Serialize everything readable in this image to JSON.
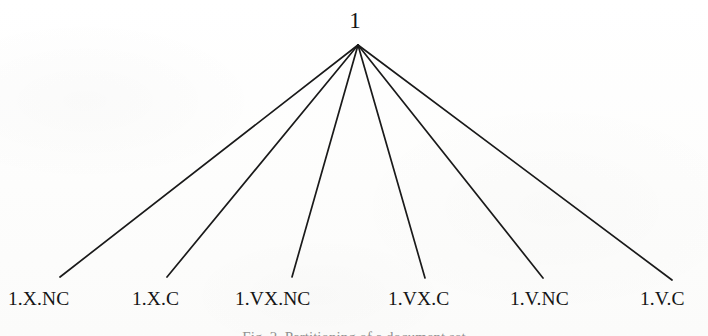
{
  "figure": {
    "caption": "Fig. 2.  Partitioning of a document set",
    "background_color": "#fdfdfc",
    "ink_color": "#151515",
    "line_color": "#1a1a1a"
  },
  "tree": {
    "root": {
      "label": "1",
      "x": 355,
      "y": 20,
      "apex_x": 358,
      "apex_y": 45
    },
    "leaves": [
      {
        "label": "1.X.NC",
        "label_x": 8,
        "line_end_x": 60,
        "line_end_y": 277
      },
      {
        "label": "1.X.C",
        "label_x": 132,
        "line_end_x": 167,
        "line_end_y": 277
      },
      {
        "label": "1.VX.NC",
        "label_x": 235,
        "line_end_x": 292,
        "line_end_y": 277
      },
      {
        "label": "1.VX.C",
        "label_x": 388,
        "line_end_x": 425,
        "line_end_y": 278
      },
      {
        "label": "1.V.NC",
        "label_x": 510,
        "line_end_x": 543,
        "line_end_y": 278
      },
      {
        "label": "1.V.C",
        "label_x": 640,
        "line_end_x": 672,
        "line_end_y": 280
      }
    ]
  },
  "chart_data": {
    "type": "diagram",
    "diagram_kind": "tree",
    "title": "Fig. 2.  Partitioning of a document set",
    "nodes": [
      "1",
      "1.X.NC",
      "1.X.C",
      "1.VX.NC",
      "1.VX.C",
      "1.V.NC",
      "1.V.C"
    ],
    "root": "1",
    "edges": [
      {
        "from": "1",
        "to": "1.X.NC"
      },
      {
        "from": "1",
        "to": "1.X.C"
      },
      {
        "from": "1",
        "to": "1.VX.NC"
      },
      {
        "from": "1",
        "to": "1.VX.C"
      },
      {
        "from": "1",
        "to": "1.V.NC"
      },
      {
        "from": "1",
        "to": "1.V.C"
      }
    ],
    "depth": 2,
    "leaf_count": 6
  }
}
